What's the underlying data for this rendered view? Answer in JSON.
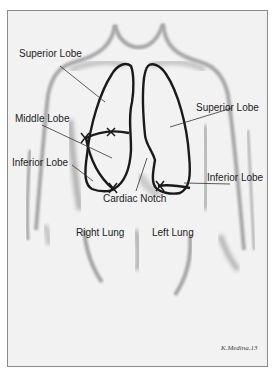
{
  "diagram": {
    "labels": {
      "superior_lobe_right": "Superior Lobe",
      "superior_lobe_left": "Superior Lobe",
      "middle_lobe": "Middle Lobe",
      "inferior_lobe_right": "Inferior Lobe",
      "inferior_lobe_left": "Inferior Lobe",
      "cardiac_notch": "Cardiac Notch",
      "right_lung": "Right Lung",
      "left_lung": "Left Lung"
    },
    "signature": "K.Medina.13",
    "colors": {
      "outline": "#1a1a1a",
      "shading": "#9a9a9a",
      "background": "#f2f2f2",
      "border": "#8a8a8a"
    }
  }
}
